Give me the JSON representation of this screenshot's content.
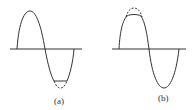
{
  "figure": {
    "panels": [
      {
        "id": "a",
        "label": "(a)",
        "description": "Sine wave with negative half-cycle clipped (flattened trough); dashed line shows the original unclipped trough"
      },
      {
        "id": "b",
        "label": "(b)",
        "description": "Sine wave with positive half-cycle clipped (flattened peak); dashed line shows the original unclipped peak"
      }
    ],
    "colors": {
      "stroke": "#333333",
      "background": "#ffffff"
    }
  }
}
